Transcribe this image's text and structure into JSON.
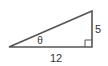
{
  "diagram": {
    "type": "right-triangle",
    "angle_label": "θ",
    "adjacent_side_label": "12",
    "opposite_side_label": "5",
    "right_angle_marker": true,
    "stroke_color": "#555555",
    "text_color": "#333333"
  }
}
